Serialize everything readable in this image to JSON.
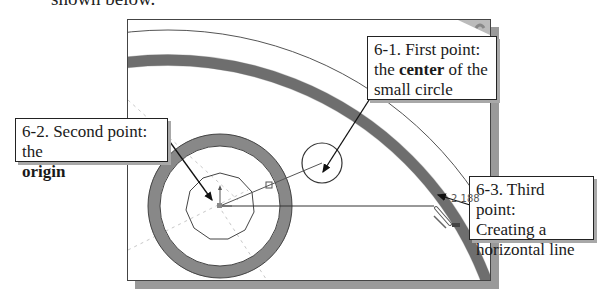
{
  "intro_text": "shown below.",
  "callouts": [
    {
      "id": "6-1",
      "line1": "6-1. First point:",
      "line2_pre": "the ",
      "line2_bold": "center",
      "line2_post": " of the",
      "line3": "small circle"
    },
    {
      "id": "6-2",
      "line1": "6-2. Second point: the",
      "line2_bold": "origin"
    },
    {
      "id": "6-3",
      "line1": "6-3. Third point:",
      "line2": "Creating a",
      "line3": "horizontal line"
    }
  ],
  "dimension_value": "2.188",
  "colors": {
    "ring": "#8a8a8a",
    "line": "#444444",
    "frame_shadow": "#9a9a9a"
  }
}
